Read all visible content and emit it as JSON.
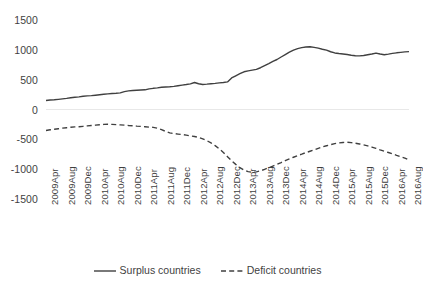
{
  "chart_data": {
    "type": "line",
    "title": "",
    "xlabel": "",
    "ylabel": "",
    "ylim": [
      -1500,
      1500
    ],
    "yticks": [
      1500,
      1000,
      500,
      0,
      -500,
      -1000,
      -1500
    ],
    "grid": "zero-line-only",
    "legend_position": "bottom",
    "categories": [
      "2009Apr",
      "2009May",
      "2009Jun",
      "2009Jul",
      "2009Aug",
      "2009Sep",
      "2009Oct",
      "2009Nov",
      "2009Dec",
      "2010Jan",
      "2010Feb",
      "2010Mar",
      "2010Apr",
      "2010May",
      "2010Jun",
      "2010Jul",
      "2010Aug",
      "2010Sep",
      "2010Oct",
      "2010Nov",
      "2010Dec",
      "2011Jan",
      "2011Feb",
      "2011Mar",
      "2011Apr",
      "2011May",
      "2011Jun",
      "2011Jul",
      "2011Aug",
      "2011Sep",
      "2011Oct",
      "2011Nov",
      "2011Dec",
      "2012Jan",
      "2012Feb",
      "2012Mar",
      "2012Apr",
      "2012May",
      "2012Jun",
      "2012Jul",
      "2012Aug",
      "2012Sep",
      "2012Oct",
      "2012Nov",
      "2012Dec",
      "2013Jan",
      "2013Feb",
      "2013Mar",
      "2013Apr",
      "2013May",
      "2013Jun",
      "2013Jul",
      "2013Aug",
      "2013Sep",
      "2013Oct",
      "2013Nov",
      "2013Dec",
      "2014Jan",
      "2014Feb",
      "2014Mar",
      "2014Apr",
      "2014May",
      "2014Jun",
      "2014Jul",
      "2014Aug",
      "2014Sep",
      "2014Oct",
      "2014Nov",
      "2014Dec",
      "2015Jan",
      "2015Feb",
      "2015Mar",
      "2015Apr",
      "2015May",
      "2015Jun",
      "2015Jul",
      "2015Aug",
      "2015Sep",
      "2015Oct",
      "2015Nov",
      "2015Dec",
      "2016Jan",
      "2016Feb",
      "2016Mar",
      "2016Apr",
      "2016May",
      "2016Jun",
      "2016Jul",
      "2016Aug"
    ],
    "xtick_labels": [
      "2009Apr",
      "2009Aug",
      "2009Dec",
      "2010Apr",
      "2010Aug",
      "2010Dec",
      "2011Apr",
      "2011Aug",
      "2011Dec",
      "2012Apr",
      "2012Aug",
      "2012Dec",
      "2013Apr",
      "2013Aug",
      "2013Dec",
      "2014Apr",
      "2014Aug",
      "2014Dec",
      "2015Apr",
      "2015Aug",
      "2015Dec",
      "2016Apr",
      "2016Aug"
    ],
    "series": [
      {
        "name": "Surplus countries",
        "style": "solid",
        "color": "#404040",
        "values": [
          150,
          158,
          163,
          170,
          178,
          186,
          196,
          205,
          212,
          222,
          228,
          232,
          240,
          248,
          255,
          262,
          268,
          272,
          278,
          300,
          312,
          318,
          322,
          326,
          330,
          345,
          355,
          362,
          372,
          378,
          382,
          388,
          398,
          408,
          418,
          430,
          452,
          432,
          420,
          425,
          432,
          438,
          446,
          452,
          462,
          530,
          565,
          600,
          632,
          648,
          660,
          672,
          700,
          735,
          770,
          808,
          838,
          880,
          920,
          960,
          995,
          1020,
          1038,
          1048,
          1052,
          1042,
          1028,
          1010,
          995,
          968,
          948,
          938,
          930,
          922,
          910,
          902,
          898,
          905,
          918,
          930,
          946,
          930,
          918,
          928,
          940,
          950,
          958,
          965,
          970
        ]
      },
      {
        "name": "Deficit countries",
        "style": "dashed",
        "color": "#404040",
        "values": [
          -352,
          -340,
          -332,
          -322,
          -312,
          -305,
          -298,
          -292,
          -288,
          -282,
          -275,
          -268,
          -262,
          -256,
          -250,
          -248,
          -250,
          -254,
          -258,
          -262,
          -268,
          -272,
          -278,
          -282,
          -288,
          -295,
          -300,
          -312,
          -338,
          -366,
          -392,
          -404,
          -412,
          -420,
          -430,
          -442,
          -452,
          -468,
          -492,
          -522,
          -560,
          -605,
          -660,
          -720,
          -790,
          -860,
          -920,
          -975,
          -1015,
          -1042,
          -1052,
          -1045,
          -1028,
          -1002,
          -975,
          -948,
          -920,
          -890,
          -858,
          -828,
          -800,
          -772,
          -748,
          -722,
          -700,
          -678,
          -652,
          -628,
          -608,
          -588,
          -572,
          -560,
          -552,
          -548,
          -556,
          -565,
          -578,
          -592,
          -610,
          -630,
          -652,
          -678,
          -700,
          -720,
          -742,
          -768,
          -792,
          -815,
          -845
        ]
      }
    ]
  },
  "legend": {
    "entries": [
      {
        "label": "Surplus countries",
        "style": "solid"
      },
      {
        "label": "Deficit countries",
        "style": "dashed"
      }
    ]
  },
  "axes": {
    "y_labels": [
      "1500",
      "1000",
      "500",
      "0",
      "-500",
      "-1000",
      "-1500"
    ]
  }
}
